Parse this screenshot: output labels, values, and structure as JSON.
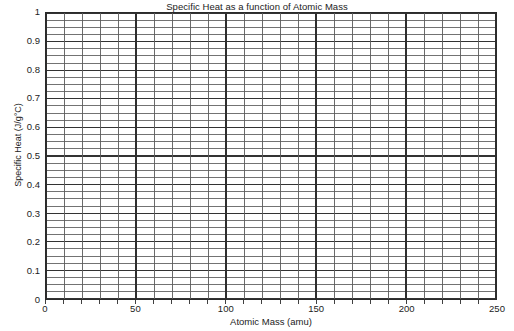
{
  "chart_data": {
    "type": "line",
    "title": "Specific Heat as a function of Atomic Mass",
    "xlabel": "Atomic Mass (amu)",
    "ylabel": "Specific Heat (J/g°C)",
    "xlim": [
      0,
      250
    ],
    "ylim": [
      0,
      1
    ],
    "x_major_tick_interval": 50,
    "x_minor_tick_interval": 10,
    "y_major_tick_interval": 0.1,
    "y_minor_tick_interval": 0.025,
    "grid": true,
    "grid_color": "#555555",
    "frame_color": "#2b2b2b",
    "background": "#ffffff",
    "legend": null,
    "legend_position": "none",
    "series": [],
    "values": [],
    "x": [],
    "annotations": [],
    "note": "Blank graph-paper template; no data points are plotted.",
    "x_tick_labels": [
      "0",
      "50",
      "100",
      "150",
      "200",
      "250"
    ],
    "x_tick_values": [
      0,
      50,
      100,
      150,
      200,
      250
    ],
    "y_tick_labels": [
      "1",
      "0.9",
      "0.8",
      "0.7",
      "0.6",
      "0.5",
      "0.4",
      "0.3",
      "0.2",
      "0.1",
      "0"
    ],
    "y_tick_values": [
      1,
      0.9,
      0.8,
      0.7,
      0.6,
      0.5,
      0.4,
      0.3,
      0.2,
      0.1,
      0
    ]
  }
}
